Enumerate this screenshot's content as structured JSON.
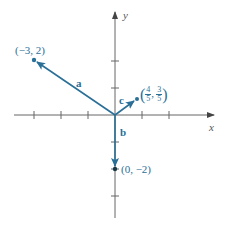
{
  "diagram": {
    "type": "vector-plot",
    "axes": {
      "x_label": "x",
      "y_label": "y"
    },
    "vectors": [
      {
        "name": "a",
        "tip_label": "(−3, 2)",
        "x": -3,
        "y": 2
      },
      {
        "name": "b",
        "tip_label": "(0, −2)",
        "x": 0,
        "y": -2
      },
      {
        "name": "c",
        "tip_label_num_x": "4",
        "tip_label_den_x": "5",
        "tip_label_num_y": "3",
        "tip_label_den_y": "5",
        "x": 0.8,
        "y": 0.6
      }
    ],
    "colors": {
      "vector": "#2a6f97",
      "axis": "#555555"
    }
  }
}
